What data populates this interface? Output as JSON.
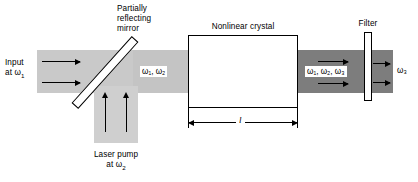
{
  "figure": {
    "type": "optical-schematic",
    "background_color": "#ffffff"
  },
  "labels": {
    "input": {
      "line1": "Input",
      "line2_prefix": "at ",
      "line2_symbol": "ω",
      "line2_sub": "1"
    },
    "mirror": {
      "line1": "Partially",
      "line2": "reflecting",
      "line3": "mirror"
    },
    "crystal": "Nonlinear crystal",
    "filter": "Filter",
    "pump": {
      "line1": "Laser pump",
      "line2_prefix": "at ",
      "line2_symbol": "ω",
      "line2_sub": "2"
    },
    "length_symbol": "l"
  },
  "beam_tags": {
    "after_mirror": {
      "parts": [
        {
          "symbol": "ω",
          "sub": "1"
        },
        {
          "symbol": "ω",
          "sub": "2"
        }
      ],
      "text": "ω₁, ω₂"
    },
    "after_crystal": {
      "parts": [
        {
          "symbol": "ω",
          "sub": "1"
        },
        {
          "symbol": "ω",
          "sub": "2"
        },
        {
          "symbol": "ω",
          "sub": "3"
        }
      ],
      "text": "ω₁, ω₂, ω₃"
    },
    "after_filter": {
      "symbol": "ω",
      "sub": "3",
      "text": "ω₃"
    }
  },
  "colors": {
    "beam_light": "#c9c9c9",
    "beam_mid": "#c4c4c4",
    "beam_dark": "#7d7d7d",
    "pump_band": "#cfcfcf",
    "outline": "#000000",
    "paper": "#ffffff"
  },
  "geometry": {
    "beam_top": 50,
    "beam_bottom": 93,
    "beam_start_x": 37,
    "beam_end_x": 393,
    "crystal_left": 188,
    "crystal_right": 297,
    "filter_x": 366
  }
}
